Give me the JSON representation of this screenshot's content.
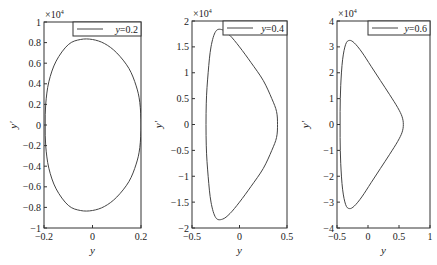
{
  "chart_data": [
    {
      "type": "line",
      "title": "",
      "xlabel": "y",
      "ylabel": "y'",
      "y_multiplier": "×10^4",
      "xlim": [
        -0.2,
        0.2
      ],
      "ylim": [
        -1,
        1
      ],
      "xticks": [
        -0.2,
        0,
        0.2
      ],
      "xtick_labels": [
        "−0.2",
        "0",
        "0.2"
      ],
      "yticks": [
        1,
        0.8,
        0.6,
        0.4,
        0.2,
        0,
        -0.2,
        -0.4,
        -0.6,
        -0.8,
        -1
      ],
      "ytick_labels": [
        "1",
        "0.8",
        "0.6",
        "0.4",
        "0.2",
        "0",
        "−0.2",
        "−0.4",
        "−0.6",
        "−0.8",
        "−1"
      ],
      "legend": [
        "y=0.2"
      ],
      "legend_position": "upper right",
      "grid": false,
      "series": [
        {
          "name": "y=0.2",
          "x": [
            0.2,
            0.195,
            0.18,
            0.15,
            0.1,
            0.05,
            0.0,
            -0.05,
            -0.1,
            -0.15,
            -0.18,
            -0.193,
            -0.195,
            -0.193,
            -0.18,
            -0.15,
            -0.1,
            -0.05,
            0.0,
            0.05,
            0.1,
            0.15,
            0.18,
            0.195,
            0.2
          ],
          "y": [
            0.0,
            0.22,
            0.38,
            0.55,
            0.7,
            0.79,
            0.83,
            0.83,
            0.78,
            0.62,
            0.42,
            0.2,
            0.0,
            -0.2,
            -0.42,
            -0.62,
            -0.78,
            -0.83,
            -0.83,
            -0.79,
            -0.7,
            -0.55,
            -0.38,
            -0.22,
            0.0
          ]
        }
      ]
    },
    {
      "type": "line",
      "title": "",
      "xlabel": "y",
      "ylabel": "y'",
      "y_multiplier": "×10^4",
      "xlim": [
        -0.5,
        0.5
      ],
      "ylim": [
        -2,
        2
      ],
      "xticks": [
        -0.5,
        0,
        0.5
      ],
      "xtick_labels": [
        "−0.5",
        "0",
        "0.5"
      ],
      "yticks": [
        2,
        1.5,
        1,
        0.5,
        0,
        -0.5,
        -1,
        -1.5,
        -2
      ],
      "ytick_labels": [
        "2",
        "1.5",
        "1",
        "0.5",
        "0",
        "−0.5",
        "−1",
        "−1.5",
        "−2"
      ],
      "legend": [
        "y=0.4"
      ],
      "legend_position": "upper right",
      "grid": false,
      "series": [
        {
          "name": "y=0.4",
          "x": [
            0.4,
            0.39,
            0.34,
            0.25,
            0.12,
            0.0,
            -0.1,
            -0.18,
            -0.25,
            -0.3,
            -0.33,
            -0.35,
            -0.35,
            -0.33,
            -0.3,
            -0.25,
            -0.18,
            -0.1,
            0.0,
            0.12,
            0.25,
            0.34,
            0.39,
            0.4
          ],
          "y": [
            0.0,
            0.25,
            0.5,
            0.85,
            1.2,
            1.5,
            1.72,
            1.83,
            1.8,
            1.5,
            1.0,
            0.4,
            -0.4,
            -1.0,
            -1.5,
            -1.8,
            -1.83,
            -1.72,
            -1.5,
            -1.2,
            -0.85,
            -0.5,
            -0.25,
            0.0
          ]
        }
      ]
    },
    {
      "type": "line",
      "title": "",
      "xlabel": "y",
      "ylabel": "y'",
      "y_multiplier": "×10^4",
      "xlim": [
        -0.5,
        1
      ],
      "ylim": [
        -4,
        4
      ],
      "xticks": [
        -0.5,
        0,
        0.5,
        1
      ],
      "xtick_labels": [
        "−0.5",
        "0",
        "0.5",
        "1"
      ],
      "yticks": [
        4,
        3,
        2,
        1,
        0,
        -1,
        -2,
        -3,
        -4
      ],
      "ytick_labels": [
        "4",
        "3",
        "2",
        "1",
        "0",
        "−1",
        "−2",
        "−3",
        "−4"
      ],
      "legend": [
        "y=0.6"
      ],
      "legend_position": "upper right",
      "grid": false,
      "series": [
        {
          "name": "y=0.6",
          "x": [
            0.57,
            0.55,
            0.48,
            0.35,
            0.2,
            0.05,
            -0.1,
            -0.22,
            -0.3,
            -0.36,
            -0.41,
            -0.44,
            -0.45,
            -0.45,
            -0.44,
            -0.41,
            -0.36,
            -0.3,
            -0.22,
            -0.1,
            0.05,
            0.2,
            0.35,
            0.48,
            0.55,
            0.57
          ],
          "y": [
            0.0,
            0.3,
            0.65,
            1.15,
            1.7,
            2.25,
            2.8,
            3.15,
            3.25,
            3.1,
            2.5,
            1.5,
            0.5,
            -0.5,
            -1.5,
            -2.5,
            -3.1,
            -3.25,
            -3.15,
            -2.8,
            -2.25,
            -1.7,
            -1.15,
            -0.65,
            -0.3,
            0.0
          ]
        }
      ]
    }
  ],
  "panels": [
    {
      "exp": "×10",
      "exp_sup": "4",
      "legend": "y=0.2",
      "legend_var": "y",
      "legend_val": "=0.2",
      "xlabel": "y",
      "ylabel": "y′"
    },
    {
      "exp": "×10",
      "exp_sup": "4",
      "legend": "y=0.4",
      "legend_var": "y",
      "legend_val": "=0.4",
      "xlabel": "y",
      "ylabel": "y′"
    },
    {
      "exp": "×10",
      "exp_sup": "4",
      "legend": "y=0.6",
      "legend_var": "y",
      "legend_val": "=0.6",
      "xlabel": "y",
      "ylabel": "y′"
    }
  ],
  "colors": {
    "line": "#444444",
    "axes": "#333333",
    "background": "#ffffff"
  }
}
